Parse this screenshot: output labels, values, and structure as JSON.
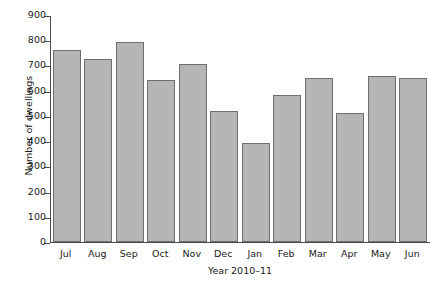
{
  "chart_data": {
    "type": "bar",
    "title": "",
    "xlabel": "Year 2010–11",
    "ylabel": "Number of dwellings",
    "categories": [
      "Jul",
      "Aug",
      "Sep",
      "Oct",
      "Nov",
      "Dec",
      "Jan",
      "Feb",
      "Mar",
      "Apr",
      "May",
      "Jun"
    ],
    "values": [
      765,
      730,
      795,
      645,
      710,
      520,
      395,
      585,
      655,
      515,
      660,
      655
    ],
    "ylim": [
      0,
      900
    ],
    "yticks": [
      0,
      100,
      200,
      300,
      400,
      500,
      600,
      700,
      800,
      900
    ],
    "ytick_labels": [
      "0",
      "100",
      "200",
      "300",
      "400",
      "500",
      "600",
      "700",
      "800",
      "900"
    ],
    "grid": false,
    "legend": null,
    "bar_color": "#b5b5b5",
    "bar_edge_color": "#6e6e6e",
    "axis_color": "#4a4a4a"
  }
}
